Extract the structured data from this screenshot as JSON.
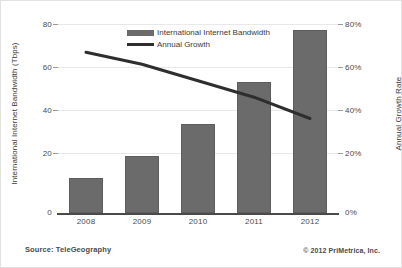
{
  "chart_data": {
    "type": "bar",
    "title": "",
    "subtitle": "",
    "categories": [
      "2008",
      "2009",
      "2010",
      "2011",
      "2012"
    ],
    "series": [
      {
        "name": "International Internet Bandwidth",
        "type": "bar",
        "axis": "left",
        "values": [
          15,
          24,
          37.5,
          55.5,
          77.5
        ],
        "color": "#6b6b6b"
      },
      {
        "name": "Annual Growth",
        "type": "line",
        "axis": "right",
        "values": [
          68,
          63,
          56,
          49,
          40
        ],
        "color": "#2e2e2e"
      }
    ],
    "xlabel": "",
    "ylabel": "International Internet Bandwidth (Tbps)",
    "y2label": "Annual Growth Rate",
    "ylim": [
      0,
      80
    ],
    "y2lim": [
      0,
      80
    ],
    "yticks": [
      "0",
      "20",
      "40",
      "60",
      "80"
    ],
    "y2ticks": [
      "0%",
      "20%",
      "40%",
      "60%",
      "80%"
    ],
    "grid": true,
    "legend_position": "top-center"
  },
  "axes": {
    "left_title": "International Internet Bandwidth (Tbps)",
    "right_title": "Annual Growth Rate"
  },
  "legend": {
    "items": [
      {
        "label": "International Internet Bandwidth",
        "marker": "bar-swatch"
      },
      {
        "label": "Annual Growth",
        "marker": "line-swatch"
      }
    ]
  },
  "footer": {
    "source": "Source: TeleGeography",
    "copyright": "© 2012 PriMetrica, Inc."
  }
}
